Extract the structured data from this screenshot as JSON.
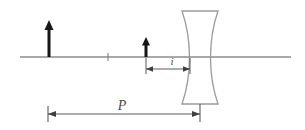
{
  "figure": {
    "width": 305,
    "height": 130,
    "background_color": "#ffffff"
  },
  "colors": {
    "axis": "#8c8c8c",
    "lens_outline": "#9a9a9a",
    "arrow": "#161616",
    "dimension_line": "#5a5a5a",
    "label_text": "#4a4a4a"
  },
  "optical_axis": {
    "name": "optical-axis",
    "x_start": 20,
    "x_end": 291,
    "y": 57,
    "center_tick": {
      "x": 108,
      "y_top": 53,
      "y_bottom": 61
    }
  },
  "object_arrow": {
    "label": "object",
    "x": 49,
    "base_y": 57,
    "tip_y": 21,
    "shaft_width": 3,
    "head_width": 9,
    "head_height": 8
  },
  "image_arrow": {
    "label": "image",
    "x": 146,
    "base_y": 57,
    "tip_y": 38,
    "shaft_width": 3,
    "head_width": 8,
    "head_height": 7
  },
  "lens": {
    "name": "diverging-lens",
    "type": "concave",
    "left_x": 182,
    "right_x": 218,
    "top_y": 11,
    "bottom_y": 104,
    "waist_inset": 13
  },
  "dimensions": [
    {
      "id": "i",
      "label": "i",
      "description": "image distance",
      "x_start": 146,
      "x_end": 190,
      "y": 69,
      "label_x": 172,
      "label_y": 65,
      "font_size": 11,
      "has_end_ticks": true,
      "tick_top": 58,
      "tick_bottom": 74
    },
    {
      "id": "P",
      "label": "P",
      "description": "object distance",
      "x_start": 48,
      "x_end": 200,
      "y": 114,
      "label_x": 122,
      "label_y": 108,
      "font_size": 14,
      "has_end_ticks": true,
      "tick_top": 106,
      "tick_bottom": 122
    }
  ]
}
